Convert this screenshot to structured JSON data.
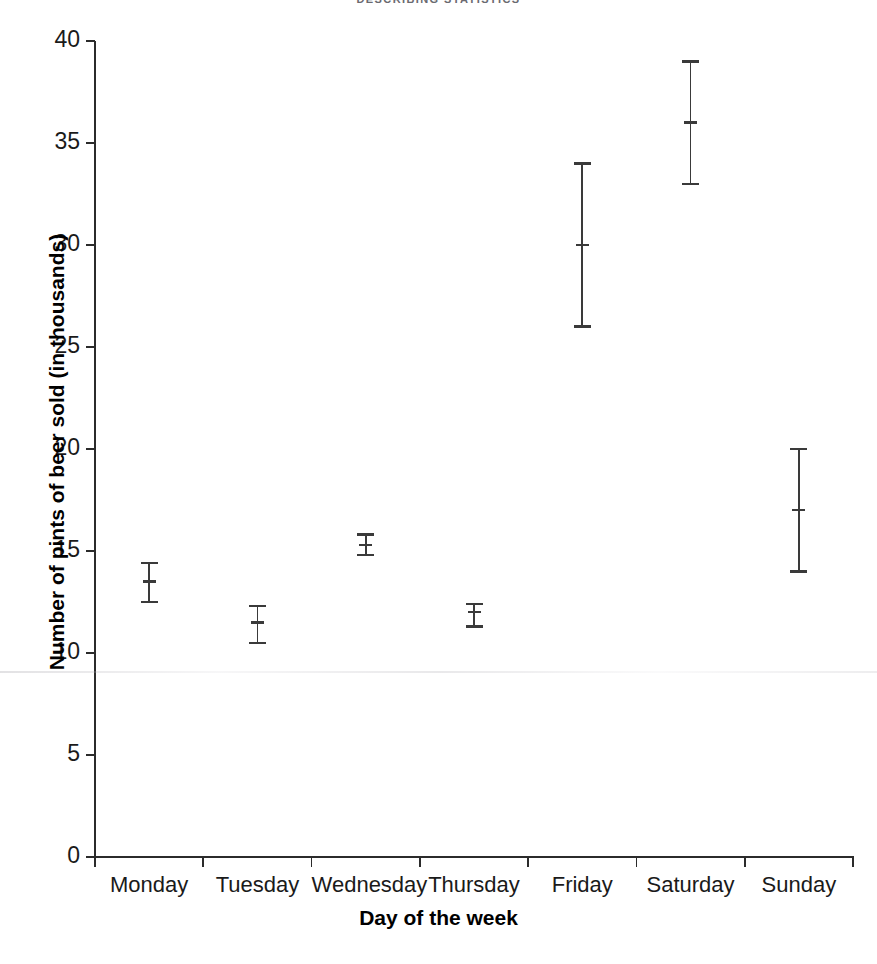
{
  "chart_data": {
    "type": "scatter",
    "title": "DESCRIBING STATISTICS",
    "xlabel": "Day of the week",
    "ylabel": "Number of pints of beer sold (in thousands)",
    "categories": [
      "Monday",
      "Tuesday",
      "Wednesday",
      "Thursday",
      "Friday",
      "Saturday",
      "Sunday"
    ],
    "values": [
      13.5,
      11.5,
      15.3,
      12.0,
      30.0,
      36.0,
      17.0
    ],
    "error_low": [
      12.5,
      10.5,
      14.8,
      11.3,
      26.0,
      33.0,
      14.0
    ],
    "error_high": [
      14.4,
      12.3,
      15.8,
      12.4,
      34.0,
      39.0,
      20.0
    ],
    "series": [
      {
        "name": "Number of pints of beer sold (in thousands)",
        "points": [
          {
            "category": "Monday",
            "mean": 13.5,
            "low": 12.5,
            "high": 14.4
          },
          {
            "category": "Tuesday",
            "mean": 11.5,
            "low": 10.5,
            "high": 12.3
          },
          {
            "category": "Wednesday",
            "mean": 15.3,
            "low": 14.8,
            "high": 15.8
          },
          {
            "category": "Thursday",
            "mean": 12.0,
            "low": 11.3,
            "high": 12.4
          },
          {
            "category": "Friday",
            "mean": 30.0,
            "low": 26.0,
            "high": 34.0
          },
          {
            "category": "Saturday",
            "mean": 36.0,
            "low": 33.0,
            "high": 39.0
          },
          {
            "category": "Sunday",
            "mean": 17.0,
            "low": 14.0,
            "high": 20.0
          }
        ]
      }
    ],
    "ylim": [
      0,
      40
    ],
    "yticks": [
      "0",
      "5",
      "10",
      "15",
      "20",
      "25",
      "30",
      "35",
      "40"
    ],
    "ytick_values": [
      0,
      5,
      10,
      15,
      20,
      25,
      30,
      35,
      40
    ],
    "grid": false,
    "legend": "none",
    "marker_color": "#3a3a3a",
    "axis_color": "#2b2b2b"
  }
}
